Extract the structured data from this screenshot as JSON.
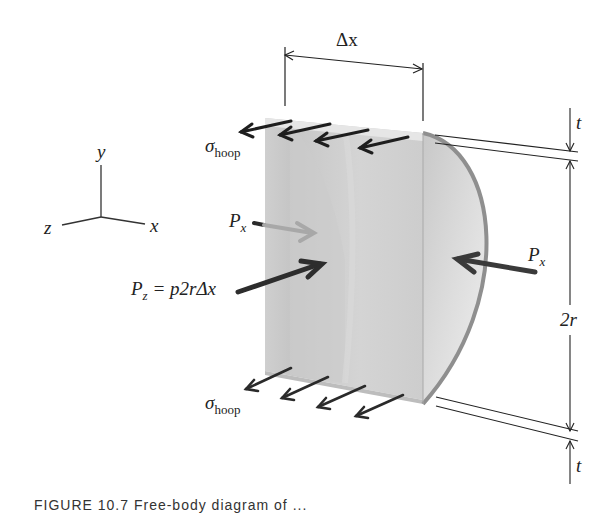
{
  "figure": {
    "axes": {
      "y": "y",
      "x": "x",
      "z": "z"
    },
    "dimensions": {
      "delta_x": "Δx",
      "thickness_top": "t",
      "thickness_bottom": "t",
      "diameter": "2r"
    },
    "forces": {
      "sigma_symbol": "σ",
      "sigma_sub": "hoop",
      "px_left_symbol": "P",
      "px_left_sub": "x",
      "px_right_symbol": "P",
      "px_right_sub": "x",
      "pz_symbol": "P",
      "pz_sub": "z",
      "pz_expression": " = p2rΔx"
    },
    "colors": {
      "block_face": "#c9c9c9",
      "block_light": "#dedede",
      "block_edge": "#8f8f8f",
      "arrow_dark": "#2a2a2a",
      "arrow_light": "#a8a8a8",
      "line": "#222222"
    },
    "caption": "FIGURE 10.7    Free-body diagram of ..."
  }
}
